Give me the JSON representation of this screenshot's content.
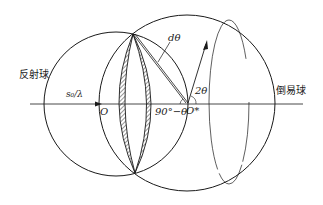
{
  "labels": {
    "reflection_sphere": "反射球",
    "reciprocal_sphere": "倒易球",
    "incident_vector": "s₀/λ",
    "origin_O": "O",
    "origin_O_prime": "O*",
    "d_theta": "dθ",
    "two_theta": "2θ",
    "ninety_minus_theta": "90°−θ"
  },
  "colors": {
    "stroke": "#1a1a1a",
    "background": "#ffffff"
  }
}
